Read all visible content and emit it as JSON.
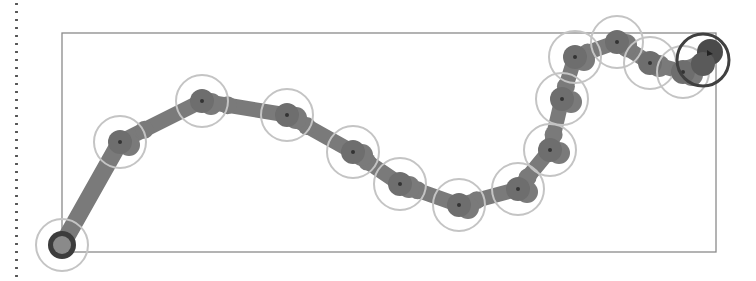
{
  "canvas": {
    "width": 756,
    "height": 281,
    "background": "#ffffff"
  },
  "colors": {
    "frame": "#8a8a8a",
    "path": "#7a7a7a",
    "node_fill": "#6e6e6e",
    "ring": "#c4c4c4",
    "start_ring": "#3c3c3c",
    "end_ring": "#404040",
    "dots": "#555555"
  },
  "frame": {
    "x": 62,
    "y": 33,
    "width": 654,
    "height": 219
  },
  "path": {
    "stroke_width": 15,
    "start": {
      "x": 62,
      "y": 245,
      "label": "start"
    },
    "end": {
      "x": 703,
      "y": 60,
      "label": "end"
    },
    "waypoints": [
      {
        "x": 120,
        "y": 142
      },
      {
        "x": 202,
        "y": 101
      },
      {
        "x": 287,
        "y": 115
      },
      {
        "x": 353,
        "y": 152
      },
      {
        "x": 400,
        "y": 184
      },
      {
        "x": 459,
        "y": 205
      },
      {
        "x": 518,
        "y": 189
      },
      {
        "x": 550,
        "y": 150
      },
      {
        "x": 562,
        "y": 99
      },
      {
        "x": 575,
        "y": 57
      },
      {
        "x": 617,
        "y": 42
      },
      {
        "x": 650,
        "y": 63
      },
      {
        "x": 683,
        "y": 72
      }
    ],
    "ring_radius": 26,
    "node_radius": 12
  }
}
